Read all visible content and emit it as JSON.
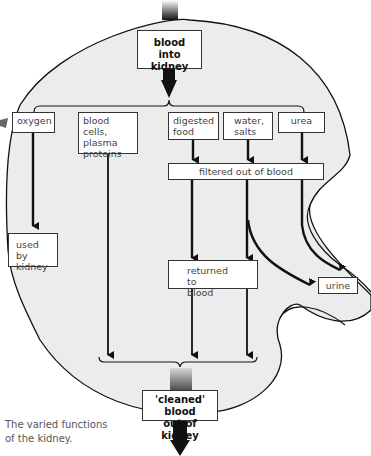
{
  "diagram": {
    "title_top": "blood into kidney",
    "top_box": {
      "line1": "blood",
      "line2": "into kidney"
    },
    "components": [
      {
        "id": "oxygen",
        "lines": [
          "oxygen"
        ]
      },
      {
        "id": "blood-cells",
        "lines": [
          "blood cells,",
          "plasma",
          "proteins"
        ]
      },
      {
        "id": "digested-food",
        "lines": [
          "digested",
          "food"
        ]
      },
      {
        "id": "water-salts",
        "lines": [
          "water,",
          "salts"
        ]
      },
      {
        "id": "urea",
        "lines": [
          "urea"
        ]
      }
    ],
    "filtered_box": "filtered out of blood",
    "used_box": {
      "line1": "used by",
      "line2": "kidney"
    },
    "returned_box": {
      "line1": "returned to",
      "line2": "blood"
    },
    "urine_box": "urine",
    "bottom_box": {
      "line1": "'cleaned' blood",
      "line2": "out of kidney"
    },
    "caption": {
      "line1": "The varied functions",
      "line2": "of the kidney."
    },
    "colors": {
      "kidney_fill": "#ececec",
      "outline": "#111111",
      "box_fill": "#ffffff",
      "arrow": "#111111"
    }
  }
}
